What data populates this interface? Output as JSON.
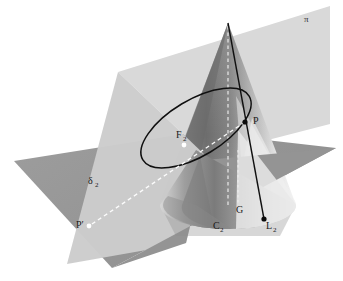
{
  "figure": {
    "type": "geometry-diagram",
    "background_color": "#ffffff",
    "canvas": {
      "width": 343,
      "height": 281
    }
  },
  "colors": {
    "horizontal_plane": "#9a9a9a",
    "horizontal_plane_shadow": "#8e8e8e",
    "cutting_plane": "#d6d6d6",
    "cutting_plane_front": "#c9c9c9",
    "cone_dark": "#6f6f6f",
    "cone_mid": "#9d9d9d",
    "cone_light": "#e8e8e8",
    "cone_base_light": "#ededed",
    "ellipse_stroke": "#111111",
    "solid_line": "#111111",
    "dashed_line": "#ffffff",
    "point_white": "#ffffff",
    "point_black": "#0a0a0a",
    "label_text": "#1a1a1a"
  },
  "labels": [
    {
      "id": "pi",
      "text": "π",
      "sub": "",
      "x": 304,
      "y": 22,
      "role": "cutting-plane-label"
    },
    {
      "id": "P",
      "text": "P",
      "sub": "",
      "x": 253,
      "y": 124,
      "role": "point-label"
    },
    {
      "id": "F2",
      "text": "F",
      "sub": "2",
      "x": 178,
      "y": 138,
      "role": "focus-label"
    },
    {
      "id": "delta2",
      "text": "δ",
      "sub": "2",
      "x": 90,
      "y": 184,
      "role": "horizontal-plane-label"
    },
    {
      "id": "Pprime",
      "text": "P′",
      "sub": "",
      "x": 78,
      "y": 227,
      "role": "projected-point-label"
    },
    {
      "id": "C2",
      "text": "C",
      "sub": "2",
      "x": 215,
      "y": 229,
      "role": "circle-label"
    },
    {
      "id": "G",
      "text": "G",
      "sub": "",
      "x": 238,
      "y": 213,
      "role": "point-label"
    },
    {
      "id": "L2",
      "text": "L",
      "sub": "2",
      "x": 268,
      "y": 228,
      "role": "line-label"
    }
  ],
  "points": [
    {
      "id": "F2-dot",
      "x": 184,
      "y": 145,
      "color": "#ffffff",
      "r": 2.4,
      "name": "focus-f2-point"
    },
    {
      "id": "P-dot",
      "x": 245,
      "y": 122,
      "color": "#0a0a0a",
      "r": 2.6,
      "name": "point-p"
    },
    {
      "id": "Pprime-dot",
      "x": 89,
      "y": 226,
      "color": "#ffffff",
      "r": 2.4,
      "name": "point-p-prime"
    },
    {
      "id": "L2-dot",
      "x": 264,
      "y": 219,
      "color": "#0a0a0a",
      "r": 2.6,
      "name": "point-l2"
    }
  ],
  "geometry": {
    "cone_apex": {
      "x": 228,
      "y": 23
    },
    "cone_base_center": {
      "x": 228,
      "y": 205
    },
    "cone_base_rx": 68,
    "cone_base_ry": 24,
    "ellipse_center": {
      "x": 196,
      "y": 128
    },
    "ellipse_rx": 62,
    "ellipse_ry": 28,
    "ellipse_rotation_deg": -31,
    "generatrix_line": {
      "x1": 228,
      "y1": 23,
      "x2": 264,
      "y2": 219
    },
    "axis_line": {
      "x1": 228,
      "y1": 26,
      "x2": 228,
      "y2": 207
    },
    "projection_line": {
      "x1": 245,
      "y1": 122,
      "x2": 89,
      "y2": 226
    }
  },
  "elements": {
    "horizontal_plane_name": "horizontal-plane-delta2",
    "cutting_plane_name": "cutting-plane-pi",
    "cone_name": "cone-surface",
    "ellipse_name": "conic-section-ellipse",
    "base_circle_name": "cone-base-circle-c2"
  }
}
